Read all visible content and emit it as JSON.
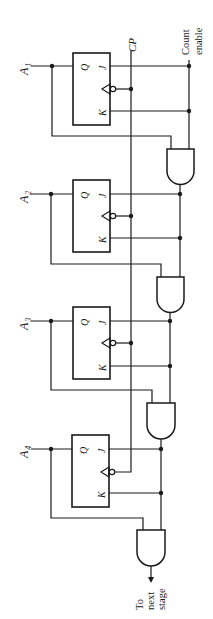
{
  "diagram": {
    "type": "circuit",
    "orientation": "rotated 90deg clockwise",
    "signals": {
      "clock_label": "CP",
      "count_enable_label_line1": "Count",
      "count_enable_label_line2": "enable",
      "output_label_line1": "To",
      "output_label_line2": "next",
      "output_label_line3": "stage"
    },
    "flip_flops": [
      {
        "id": "ff1",
        "output_label": "A",
        "output_sub": "1",
        "pin_q": "Q",
        "pin_j": "J",
        "pin_k": "K"
      },
      {
        "id": "ff2",
        "output_label": "A",
        "output_sub": "2",
        "pin_q": "Q",
        "pin_j": "J",
        "pin_k": "K"
      },
      {
        "id": "ff3",
        "output_label": "A",
        "output_sub": "3",
        "pin_q": "Q",
        "pin_j": "J",
        "pin_k": "K"
      },
      {
        "id": "ff4",
        "output_label": "A",
        "output_sub": "4",
        "pin_q": "Q",
        "pin_j": "J",
        "pin_k": "K"
      }
    ],
    "gates": [
      {
        "id": "and1",
        "type": "AND",
        "inputs": [
          "A1",
          "Count enable"
        ]
      },
      {
        "id": "and2",
        "type": "AND",
        "inputs": [
          "A2",
          "and1"
        ]
      },
      {
        "id": "and3",
        "type": "AND",
        "inputs": [
          "A3",
          "and2"
        ]
      },
      {
        "id": "and4",
        "type": "AND",
        "inputs": [
          "A4",
          "and3"
        ]
      }
    ]
  }
}
